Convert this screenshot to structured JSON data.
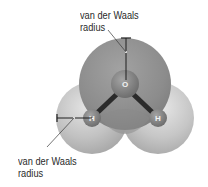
{
  "diagram": {
    "atoms": [
      {
        "id": "oxygen",
        "symbol": "O"
      },
      {
        "id": "hydrogen-left",
        "symbol": "H"
      },
      {
        "id": "hydrogen-right",
        "symbol": "H"
      }
    ],
    "labels": {
      "top": {
        "line1": "van der Waals",
        "line2": "radius"
      },
      "bottom": {
        "line1": "van der Waals",
        "line2": "radius"
      }
    },
    "colors": {
      "oxygen_sphere": "#8f8f8f",
      "hydrogen_sphere": "#c4c4c4",
      "nucleus": "#7a7a7a",
      "bond": "#2b2b2b",
      "text": "#2a2a2a"
    }
  }
}
